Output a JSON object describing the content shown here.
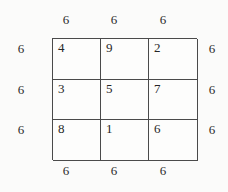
{
  "figure": {
    "grid": {
      "rows": [
        [
          "4",
          "9",
          "2"
        ],
        [
          "3",
          "5",
          "7"
        ],
        [
          "8",
          "1",
          "6"
        ]
      ]
    },
    "sums": {
      "top": [
        "6",
        "6",
        "6"
      ],
      "bottom": [
        "6",
        "6",
        "6"
      ],
      "left": [
        "6",
        "6",
        "6"
      ],
      "right": [
        "6",
        "6",
        "6"
      ]
    },
    "colors": {
      "background": "#fbfbfa",
      "grid_line": "#4a4a4a",
      "text": "#262626"
    }
  }
}
